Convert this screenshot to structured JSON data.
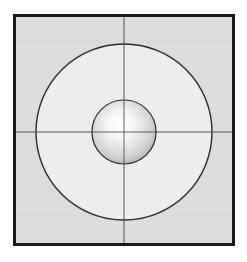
{
  "figure": {
    "canvas": {
      "width": 247,
      "height": 262,
      "background": "#ffffff"
    },
    "frame": {
      "name": "square-border",
      "x": 13,
      "y": 14,
      "width": 222,
      "height": 232,
      "stroke": "#1a1a1a",
      "stroke_width": 3,
      "fill_outside_circle": "#dcdcdc"
    },
    "outer_circle": {
      "name": "outer-circle",
      "cx": 124,
      "cy": 132,
      "r": 88,
      "stroke": "#2b2b2b",
      "stroke_width": 1.4,
      "fill": "#ededed"
    },
    "inner_sphere": {
      "name": "inner-sphere",
      "cx": 124,
      "cy": 132,
      "r": 32,
      "stroke": "#2b2b2b",
      "stroke_width": 1.2,
      "highlight_color": "#ffffff",
      "mid_color": "#e3e3e3",
      "edge_color": "#a9a9a9",
      "highlight_cx_pct": 46,
      "highlight_cy_pct": 42
    },
    "crosshair": {
      "name": "crosshair",
      "vertical_x": 124,
      "horizontal_y": 132,
      "stroke": "#555555",
      "stroke_width": 1,
      "extends_to": "square-border"
    }
  },
  "chart_data": {
    "type": "scatter",
    "xlabel": "",
    "ylabel": "",
    "xlim": [
      13,
      235
    ],
    "ylim": [
      14,
      246
    ],
    "grid": false,
    "legend": "none",
    "annotations": [
      {
        "label": "square frame",
        "x": 124,
        "y": 130,
        "half_width": 111,
        "half_height": 116
      },
      {
        "label": "outer circle",
        "x": 124,
        "y": 132,
        "radius": 88
      },
      {
        "label": "inner sphere",
        "x": 124,
        "y": 132,
        "radius": 32
      },
      {
        "label": "vertical axis line",
        "x": 124,
        "y": 130
      },
      {
        "label": "horizontal axis line",
        "x": 124,
        "y": 132
      }
    ],
    "series": [
      {
        "name": "center point",
        "x": [
          124
        ],
        "y": [
          132
        ]
      }
    ]
  }
}
